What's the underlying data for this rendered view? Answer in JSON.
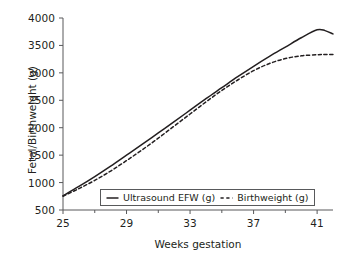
{
  "chart_data": {
    "type": "line",
    "title": "",
    "xlabel": "Weeks gestation",
    "ylabel": "Fetal/Birthweight (g)",
    "xlim": [
      25,
      42
    ],
    "ylim": [
      500,
      4000
    ],
    "grid": false,
    "legend_position": "lower center inside axes",
    "xticks": [
      25,
      29,
      33,
      37,
      41
    ],
    "xtick_labels": [
      "25",
      "29",
      "33",
      "37",
      "41"
    ],
    "x_minor_ticks": [
      27,
      31,
      35,
      39
    ],
    "yticks": [
      500,
      1000,
      1500,
      2000,
      2500,
      3000,
      3500,
      4000
    ],
    "ytick_labels": [
      "500",
      "1000",
      "1500",
      "2000",
      "2500",
      "3000",
      "3500",
      "4000"
    ],
    "x": [
      25,
      26,
      27,
      28,
      29,
      30,
      31,
      32,
      33,
      34,
      35,
      36,
      37,
      38,
      39,
      40,
      41,
      41.5,
      42
    ],
    "series": [
      {
        "name": "Ultrasound EFW (g)",
        "style": "solid",
        "color": "#231f20",
        "values": [
          760,
          930,
          1110,
          1300,
          1500,
          1700,
          1905,
          2110,
          2320,
          2530,
          2730,
          2930,
          3120,
          3300,
          3470,
          3640,
          3785,
          3770,
          3710
        ]
      },
      {
        "name": "Birthweight (g)",
        "style": "dashed",
        "color": "#231f20",
        "values": [
          750,
          890,
          1040,
          1210,
          1400,
          1600,
          1810,
          2030,
          2250,
          2470,
          2680,
          2870,
          3040,
          3170,
          3260,
          3310,
          3330,
          3333,
          3335
        ]
      }
    ]
  },
  "legend": {
    "items": [
      {
        "label": "Ultrasound EFW (g)",
        "style": "solid"
      },
      {
        "label": "Birthweight (g)",
        "style": "dashed"
      }
    ]
  }
}
